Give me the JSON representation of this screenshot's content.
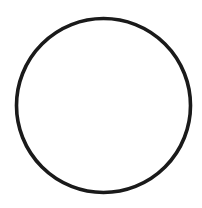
{
  "diagram": {
    "shape": "circle",
    "center": [
      103.5,
      105.5
    ],
    "radius": 87,
    "stroke_width": 3.6,
    "stroke_color": "#1a1a1a",
    "fill_color": "#ffffff",
    "background": "#ffffff"
  }
}
